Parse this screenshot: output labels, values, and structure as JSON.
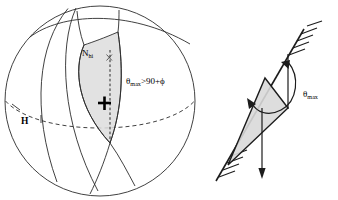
{
  "figure": {
    "title": "",
    "panels": [
      {
        "id": "sphere-panel",
        "name": "spherical-geometry-diagram",
        "labels": {
          "n_hi": "N",
          "n_hi_sub": "hi",
          "theta_expr_theta": "θ",
          "theta_expr_sub": "max",
          "theta_expr_rest": ">90+ϕ",
          "h_label": "H",
          "plus_marker": "+",
          "x_marker": "x"
        }
      },
      {
        "id": "wedge-panel",
        "name": "wedge-slope-diagram",
        "labels": {
          "theta_label": "θ",
          "theta_label_sub": "max"
        }
      }
    ],
    "colors": {
      "ink": "#1c1c1c",
      "line": "#2b2b2b",
      "shade": "#dddddd",
      "background": "#ffffff"
    }
  }
}
